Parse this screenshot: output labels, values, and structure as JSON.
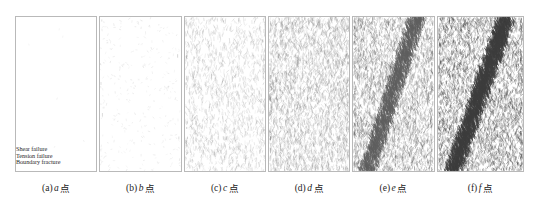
{
  "figure": {
    "name": "crack-evolution-panels",
    "panel_count": 6,
    "legend": {
      "items": [
        {
          "label": "Shear failure",
          "color": "#4d4d4d"
        },
        {
          "label": "Tension failure",
          "color": "#4d4d4d"
        },
        {
          "label": "Boundary fracture",
          "color": "#4d4d4d"
        }
      ]
    },
    "captions": [
      {
        "index": "(a)",
        "symbol": "a",
        "suffix": "点"
      },
      {
        "index": "(b)",
        "symbol": "b",
        "suffix": "点"
      },
      {
        "index": "(c)",
        "symbol": "c",
        "suffix": "点"
      },
      {
        "index": "(d)",
        "symbol": "d",
        "suffix": "点"
      },
      {
        "index": "(e)",
        "symbol": "e",
        "suffix": "点"
      },
      {
        "index": "(f)",
        "symbol": "f",
        "suffix": "点"
      }
    ],
    "panels": [
      {
        "id": "panel-a",
        "label": "a",
        "crack_count": 6,
        "density": 0.02,
        "band": false,
        "band_intensity": 0.0,
        "seed": 11,
        "stroke": "#b5b5b5",
        "width_px": 80
      },
      {
        "id": "panel-b",
        "label": "b",
        "crack_count": 300,
        "density": 0.12,
        "band": false,
        "band_intensity": 0.0,
        "seed": 23,
        "stroke": "#a8a8a8",
        "width_px": 80
      },
      {
        "id": "panel-c",
        "label": "c",
        "crack_count": 1500,
        "density": 0.42,
        "band": false,
        "band_intensity": 0.0,
        "seed": 37,
        "stroke": "#8e8e8e",
        "width_px": 80
      },
      {
        "id": "panel-d",
        "label": "d",
        "crack_count": 3000,
        "density": 0.62,
        "band": false,
        "band_intensity": 0.0,
        "seed": 53,
        "stroke": "#7d7d7d",
        "width_px": 80
      },
      {
        "id": "panel-e",
        "label": "e",
        "crack_count": 4800,
        "density": 0.8,
        "band": true,
        "band_intensity": 0.75,
        "seed": 71,
        "stroke": "#5e5e5e",
        "width_px": 80
      },
      {
        "id": "panel-f",
        "label": "f",
        "crack_count": 6200,
        "density": 0.95,
        "band": true,
        "band_intensity": 1.0,
        "seed": 97,
        "stroke": "#3c3c3c",
        "width_px": 85
      }
    ],
    "border_color": "#b9b9b9",
    "background_color": "#ffffff"
  }
}
